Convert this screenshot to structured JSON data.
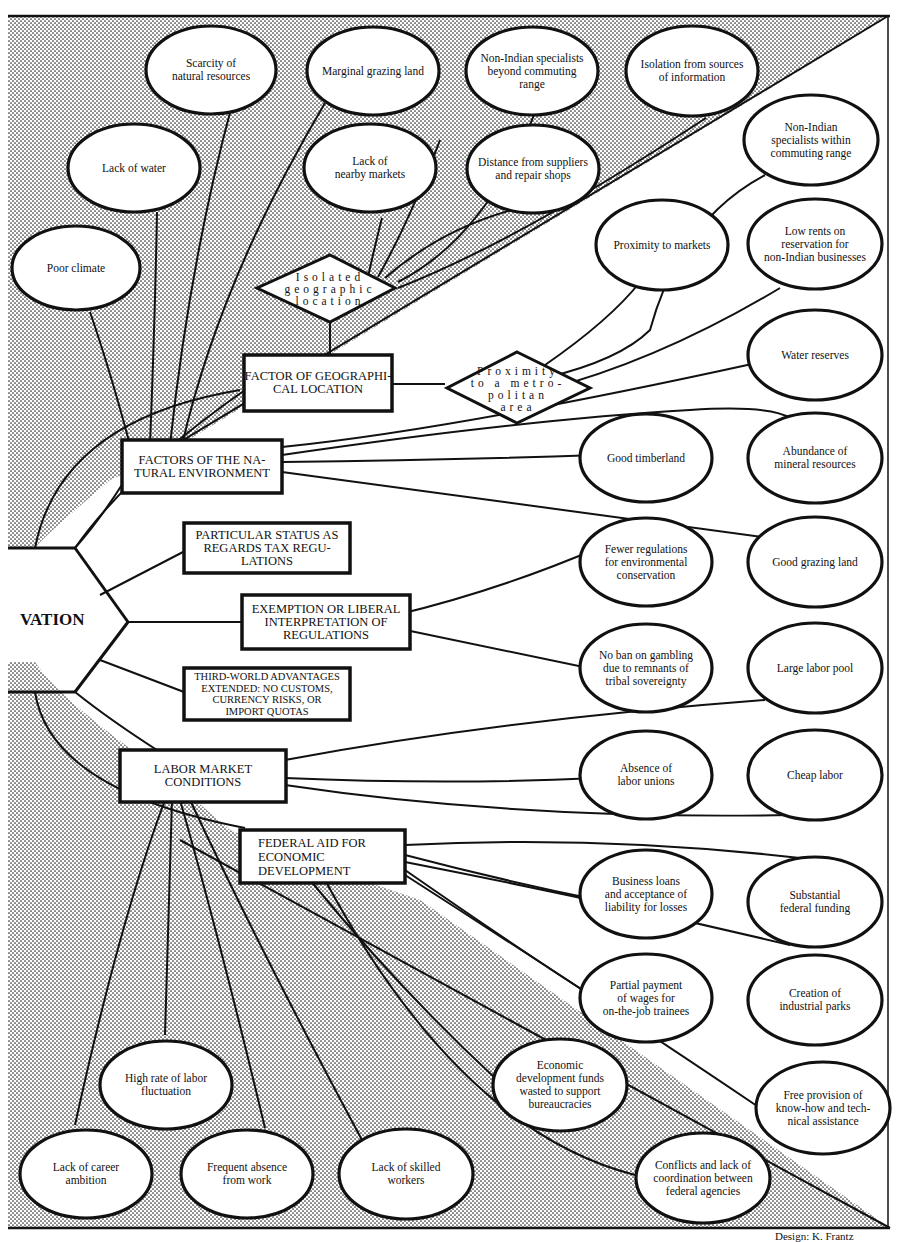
{
  "hub": {
    "label": "VATION"
  },
  "factors": {
    "geo": {
      "label": "FACTOR OF GEOGRAPHI-\nCAL LOCATION"
    },
    "nat": {
      "label": "FACTORS OF THE NA-\nTURAL ENVIRONMENT"
    },
    "tax": {
      "label": "PARTICULAR STATUS AS\nREGARDS TAX REGU-\nLATIONS"
    },
    "reg": {
      "label": "EXEMPTION OR LIBERAL\nINTERPRETATION OF\nREGULATIONS"
    },
    "third": {
      "label": "THIRD-WORLD ADVANTAGES\nEXTENDED: NO CUSTOMS,\nCURRENCY RISKS, OR\nIMPORT QUOTAS"
    },
    "labor": {
      "label": "LABOR MARKET\nCONDITIONS"
    },
    "fed": {
      "label": "FEDERAL AID FOR\nECONOMIC\nDEVELOPMENT"
    }
  },
  "diamonds": {
    "isolated": {
      "label": "Isolated\ngeographic\nlocation"
    },
    "proximity": {
      "label": "Proximity\nto a metro-\npolitan\narea"
    }
  },
  "disadvantages_top": [
    {
      "id": "poor-climate",
      "label": "Poor climate"
    },
    {
      "id": "lack-of-water",
      "label": "Lack of water"
    },
    {
      "id": "scarcity",
      "label": "Scarcity of\nnatural resources"
    },
    {
      "id": "marginal-grazing",
      "label": "Marginal grazing land"
    },
    {
      "id": "nearby-markets",
      "label": "Lack of\nnearby markets"
    },
    {
      "id": "specialists-beyond",
      "label": "Non-Indian specialists\nbeyond commuting\nrange"
    },
    {
      "id": "distance-suppliers",
      "label": "Distance from suppliers\nand repair shops"
    },
    {
      "id": "isolation-info",
      "label": "Isolation from sources\nof information"
    }
  ],
  "advantages": [
    {
      "id": "specialists-within",
      "label": "Non-Indian\nspecialists within\ncommuting range"
    },
    {
      "id": "proximity-markets",
      "label": "Proximity to markets"
    },
    {
      "id": "low-rents",
      "label": "Low rents on\nreservation for\nnon-Indian businesses"
    },
    {
      "id": "water-reserves",
      "label": "Water reserves"
    },
    {
      "id": "timberland",
      "label": "Good timberland"
    },
    {
      "id": "minerals",
      "label": "Abundance of\nmineral resources"
    },
    {
      "id": "fewer-regs",
      "label": "Fewer regulations\nfor environmental\nconservation"
    },
    {
      "id": "good-grazing",
      "label": "Good grazing land"
    },
    {
      "id": "no-gambling-ban",
      "label": "No ban on gambling\ndue to remnants of\ntribal sovereignty"
    },
    {
      "id": "labor-pool",
      "label": "Large labor pool"
    },
    {
      "id": "no-unions",
      "label": "Absence of\nlabor unions"
    },
    {
      "id": "cheap-labor",
      "label": "Cheap labor"
    },
    {
      "id": "business-loans",
      "label": "Business loans\nand acceptance of\nliability for losses"
    },
    {
      "id": "federal-funding",
      "label": "Substantial\nfederal funding"
    },
    {
      "id": "partial-wages",
      "label": "Partial payment\nof wages for\non-the-job trainees"
    },
    {
      "id": "industrial-parks",
      "label": "Creation of\nindustrial parks"
    },
    {
      "id": "know-how",
      "label": "Free provision of\nknow-how and tech-\nnical assistance"
    }
  ],
  "disadvantages_bottom": [
    {
      "id": "labor-fluctuation",
      "label": "High rate of labor\nfluctuation"
    },
    {
      "id": "career-ambition",
      "label": "Lack of career\nambition"
    },
    {
      "id": "absence-work",
      "label": "Frequent absence\nfrom work"
    },
    {
      "id": "skilled-workers",
      "label": "Lack of skilled\nworkers"
    },
    {
      "id": "funds-wasted",
      "label": "Economic\ndevelopment funds\nwasted to support\nbureaucracies"
    },
    {
      "id": "conflicts",
      "label": "Conflicts and lack of\ncoordination between\nfederal agencies"
    }
  ],
  "credit": "Design: K. Frantz",
  "colors": {
    "ink": "#111111",
    "paper": "#ffffff",
    "dot": "#2a2a2a"
  }
}
